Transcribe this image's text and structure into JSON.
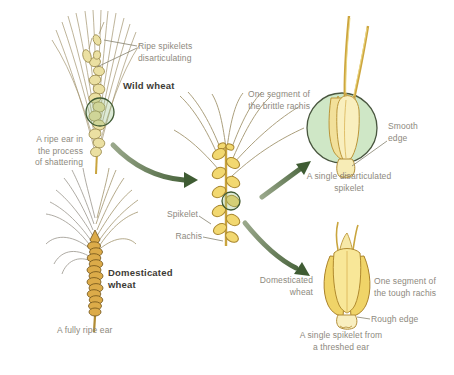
{
  "diagram": {
    "wild": {
      "callout": "Ripe spikelets\ndisarticulating",
      "title": "Wild wheat",
      "caption": "A ripe ear in\nthe process\nof shattering"
    },
    "domesticated": {
      "title": "Domesticated\nwheat",
      "caption": "A fully ripe ear"
    },
    "center": {
      "spikelet_label": "Spikelet",
      "rachis_label": "Rachis"
    },
    "brittle": {
      "segment_label": "One segment of\nthe brittle rachis",
      "smooth_label": "Smooth\nedge",
      "caption": "A single disarticulated\nspikelet"
    },
    "tough": {
      "arrow_label": "Domesticated\nwheat",
      "segment_label": "One segment of\nthe tough rachis",
      "rough_label": "Rough edge",
      "caption": "A single spikelet from\na threshed ear"
    }
  },
  "colors": {
    "bg": "#ffffff",
    "arrow_green_dark": "#3f5c33",
    "arrow_green_light": "#9aa88b",
    "circle_fill": "#cfe7c6",
    "circle_stroke": "#49563f",
    "wheat_pale": "#ebe0a2",
    "wheat_pale_outline": "#9a8a4c",
    "wheat_gold": "#f2d870",
    "wheat_outline": "#a8862e",
    "wheat_deep_gold": "#dcab49",
    "wheat_deep_outline": "#6f5218",
    "wheat_cream": "#f9efbe",
    "wheat_cream_outline": "#bb9538",
    "awn_brown": "#998a60",
    "awn_gray": "#908c82",
    "stem_gold": "#c9a43e",
    "leader": "#85816f",
    "label_gray": "#8d897e",
    "title_dark": "#3d3b35",
    "zoom_ring": "#3f5a33",
    "zoom_ring_fill": "rgba(150,190,130,0.32)"
  }
}
